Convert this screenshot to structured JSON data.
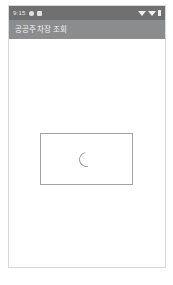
{
  "status_bar": {
    "time": "9:15",
    "left_icons": [
      "notification-icon",
      "notification-icon"
    ],
    "right_icons": [
      "wifi-icon",
      "signal-icon",
      "battery-icon"
    ],
    "background_color": "#6f7072"
  },
  "app_bar": {
    "title": "공공주차장 조회",
    "background_color": "#8b8c8e",
    "text_color": "#f2f2f2"
  },
  "content": {
    "background_color": "#ffffff",
    "loading_card": {
      "border_color": "#a2a2a2",
      "spinner": {
        "name": "loading-spinner",
        "color": "#9a9a9a"
      }
    }
  },
  "frame": {
    "border_color": "#d8d8d8",
    "background_color": "#ffffff"
  }
}
